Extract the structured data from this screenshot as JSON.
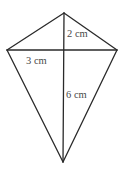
{
  "diagram": {
    "type": "kite-with-diagonals",
    "background_color": "#ffffff",
    "stroke_color": "#2a2a2a",
    "stroke_width": 1.3,
    "label_color": "#4a4a4a",
    "vertices": {
      "top": [
        64,
        13
      ],
      "left": [
        7,
        50
      ],
      "right": [
        117,
        50
      ],
      "bottom": [
        63,
        162
      ]
    },
    "edges": [
      [
        "top",
        "left"
      ],
      [
        "top",
        "right"
      ],
      [
        "left",
        "bottom"
      ],
      [
        "right",
        "bottom"
      ]
    ],
    "diagonals": [
      [
        "top",
        "bottom"
      ],
      [
        "left",
        "right"
      ]
    ],
    "labels": [
      {
        "name": "label-2cm",
        "text": "2 cm",
        "x": 67,
        "y": 37
      },
      {
        "name": "label-3cm",
        "text": "3 cm",
        "x": 26,
        "y": 64
      },
      {
        "name": "label-6cm",
        "text": "6 cm",
        "x": 66,
        "y": 98
      }
    ]
  }
}
